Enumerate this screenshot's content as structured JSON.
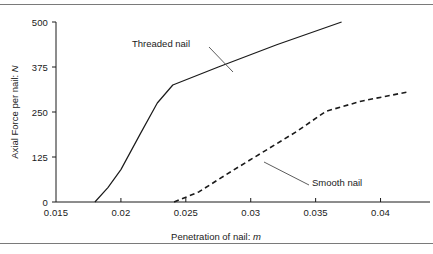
{
  "figure": {
    "background": "#ffffff",
    "line_color": "#1a1a1a",
    "rule_color": "#7a7a7a"
  },
  "axes": {
    "x": {
      "title_text": "Penetration of nail: ",
      "title_symbol": "m",
      "ticks": [
        "0.015",
        "0.02",
        "0.025",
        "0.03",
        "0.035",
        "0.04"
      ],
      "tick_values": [
        0.015,
        0.02,
        0.025,
        0.03,
        0.035,
        0.04
      ],
      "min": 0.015,
      "max": 0.0425
    },
    "y": {
      "title_text": "Axial Force per nail: ",
      "title_symbol": "N",
      "ticks": [
        "0",
        "125",
        "250",
        "375",
        "500"
      ],
      "tick_values": [
        0,
        125,
        250,
        375,
        500
      ],
      "min": 0,
      "max": 500
    }
  },
  "annotations": {
    "threaded_label": "Threaded nail",
    "smooth_label": "Smooth nail"
  },
  "chart_data": {
    "type": "line",
    "title": "",
    "xlabel": "Penetration of nail: m",
    "ylabel": "Axial Force per nail: N",
    "xlim": [
      0.015,
      0.0425
    ],
    "ylim": [
      0,
      500
    ],
    "grid": false,
    "legend": "inline-annotations",
    "series": [
      {
        "name": "Threaded nail",
        "style": "solid",
        "color": "#1a1a1a",
        "points": [
          {
            "x": 0.018,
            "y": 0
          },
          {
            "x": 0.019,
            "y": 40
          },
          {
            "x": 0.02,
            "y": 90
          },
          {
            "x": 0.0215,
            "y": 190
          },
          {
            "x": 0.0228,
            "y": 275
          },
          {
            "x": 0.024,
            "y": 325
          },
          {
            "x": 0.0275,
            "y": 375
          },
          {
            "x": 0.032,
            "y": 437
          },
          {
            "x": 0.037,
            "y": 500
          }
        ]
      },
      {
        "name": "Smooth nail",
        "style": "dashed",
        "color": "#1a1a1a",
        "points": [
          {
            "x": 0.0241,
            "y": 0
          },
          {
            "x": 0.026,
            "y": 28
          },
          {
            "x": 0.0285,
            "y": 85
          },
          {
            "x": 0.031,
            "y": 140
          },
          {
            "x": 0.0335,
            "y": 195
          },
          {
            "x": 0.0358,
            "y": 252
          },
          {
            "x": 0.0385,
            "y": 280
          },
          {
            "x": 0.042,
            "y": 305
          }
        ]
      }
    ]
  }
}
